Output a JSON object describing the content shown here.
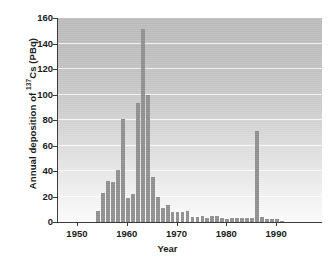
{
  "chart_data": {
    "type": "bar",
    "title": "",
    "xlabel": "Year",
    "ylabel_parts": {
      "pre": "Annual deposition of ",
      "sup": "137",
      "post": "Cs (PBq)"
    },
    "ylabel": "Annual deposition of 137Cs (PBq)",
    "xlim": [
      1946,
      1999
    ],
    "ylim": [
      0,
      160
    ],
    "yticks": [
      0,
      20,
      40,
      60,
      80,
      100,
      120,
      140,
      160
    ],
    "xticks": [
      1950,
      1960,
      1970,
      1980,
      1990
    ],
    "grid": "horizontal",
    "legend": "none",
    "bar_color": "#8c8c8c",
    "categories": [
      1954,
      1955,
      1956,
      1957,
      1958,
      1959,
      1960,
      1961,
      1962,
      1963,
      1964,
      1965,
      1966,
      1967,
      1968,
      1969,
      1970,
      1971,
      1972,
      1973,
      1974,
      1975,
      1976,
      1977,
      1978,
      1979,
      1980,
      1981,
      1982,
      1983,
      1984,
      1985,
      1986,
      1987,
      1988,
      1989,
      1990,
      1991
    ],
    "values": [
      9,
      23,
      32,
      31,
      41,
      81,
      19,
      22,
      93,
      151,
      100,
      35,
      20,
      11,
      13,
      8,
      8,
      8,
      9,
      4,
      4,
      5,
      3,
      5,
      5,
      3,
      2,
      3,
      3,
      3,
      3,
      3,
      71,
      4,
      2,
      2,
      2,
      1
    ],
    "annotations": []
  },
  "axis": {
    "xlabel_text": "Year",
    "ytick_labels": [
      "0",
      "20",
      "40",
      "60",
      "80",
      "100",
      "120",
      "140",
      "160"
    ],
    "xtick_labels": [
      "1950",
      "1960",
      "1970",
      "1980",
      "1990"
    ]
  }
}
